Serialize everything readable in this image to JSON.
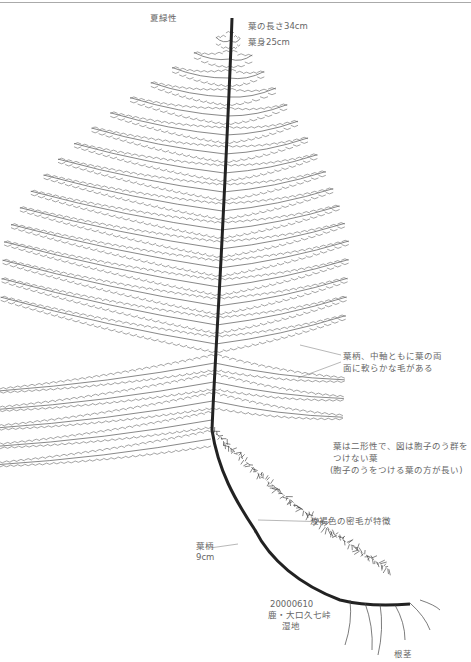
{
  "labels": {
    "habit": "夏緑性",
    "frond_length": "葉の長さ34cm",
    "blade_length": "葉身25cm",
    "hair_note_line1": "葉柄、中軸ともに葉の両",
    "hair_note_line2": "面に軟らかな毛がある",
    "dimorphic_line1": "葉は二形性で、図は胞子のう群を",
    "dimorphic_line2": "つけない葉",
    "dimorphic_line3": "(胞子のうをつける葉の方が長い)",
    "scales_note": "淡褐色の密毛が特徴",
    "stipe_label": "葉柄",
    "stipe_length": "9cm",
    "date": "20000610",
    "locality": "鹿・大口久七峠",
    "habitat": "湿地",
    "rhizome": "根茎"
  },
  "colors": {
    "ink": "#555555",
    "dark_ink": "#222222",
    "text": "#666666",
    "rule": "#aaaaaa"
  }
}
